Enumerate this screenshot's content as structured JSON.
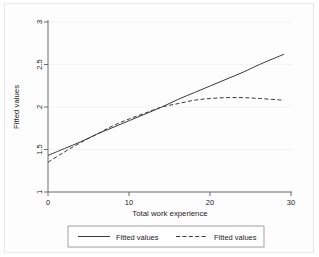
{
  "chart_data": {
    "type": "line",
    "title": "",
    "xlabel": "Total work experience",
    "ylabel": "Fitted values",
    "xlim": [
      0,
      30
    ],
    "ylim": [
      1,
      3
    ],
    "xticks": [
      0,
      10,
      20,
      30
    ],
    "xtick_labels": [
      "0",
      "10",
      "20",
      "30"
    ],
    "yticks": [
      1,
      1.5,
      2,
      2.5,
      3
    ],
    "ytick_labels": [
      "1",
      "1.5",
      "2",
      "2.5",
      "3"
    ],
    "grid": "horizontal-faint",
    "legend_position": "bottom-outside",
    "series": [
      {
        "name": "Fitted values",
        "style": "solid",
        "color": "#3a3a3a",
        "x": [
          0,
          2,
          4,
          6,
          8,
          10,
          12,
          14,
          16,
          18,
          20,
          22,
          24,
          26,
          29
        ],
        "values": [
          1.43,
          1.51,
          1.59,
          1.68,
          1.76,
          1.84,
          1.92,
          2.0,
          2.09,
          2.17,
          2.25,
          2.33,
          2.41,
          2.5,
          2.62
        ]
      },
      {
        "name": "Fitted values",
        "style": "dashed",
        "color": "#3a3a3a",
        "x": [
          0,
          2,
          4,
          6,
          8,
          10,
          12,
          14,
          16,
          18,
          20,
          22,
          24,
          26,
          29
        ],
        "values": [
          1.35,
          1.47,
          1.58,
          1.68,
          1.78,
          1.86,
          1.93,
          2.0,
          2.04,
          2.08,
          2.1,
          2.11,
          2.11,
          2.1,
          2.08
        ]
      }
    ],
    "legend_entries": [
      {
        "label": "Fitted values",
        "style": "solid"
      },
      {
        "label": "Fitted values",
        "style": "dashed"
      }
    ]
  }
}
